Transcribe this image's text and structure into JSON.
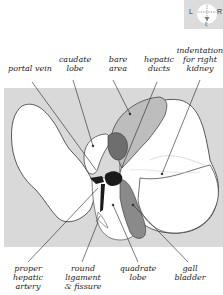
{
  "orientation": {
    "left_label": "L",
    "right_label": "R",
    "bottom_label": "I"
  },
  "labels_top": {
    "portal_vein": "portal vein",
    "caudate_lobe": "caudate\nlobe",
    "bare_area": "bare\narea",
    "hepatic_ducts": "hepatic\nducts",
    "indentation": "indentation\nfor right\nkidney"
  },
  "labels_bottom": {
    "proper_hepatic_artery": "proper\nhepatic\nartery",
    "round_ligament": "round\nligament\n& fissure",
    "quadrate_lobe": "quadrate\nlobe",
    "gall_bladder": "gall\nbladder"
  },
  "colors": {
    "background_panel": "#d9d9d9",
    "liver": "#ffffff",
    "bare_area": "#bdbdbd",
    "caudate_dark": "#6e6e6e",
    "gall_bladder": "#8a8a8a",
    "vessels": "#1a1a1a",
    "outline": "#333333"
  }
}
